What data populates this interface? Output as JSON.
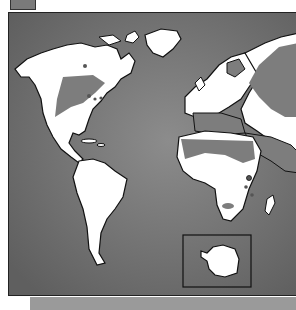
{
  "map": {
    "type": "world-map",
    "legend": {
      "swatch_color": "#7a7a7a"
    },
    "colors": {
      "ocean": "#6e6e6e",
      "ocean_highlight": "#8a8a8a",
      "land": "#ffffff",
      "shaded_region": "#7d7d7d",
      "outline": "#111111",
      "bottom_strip": "#9a9a9a"
    },
    "regions": [
      "North America",
      "South America",
      "Europe",
      "Africa",
      "Asia",
      "Greenland",
      "Antarctica (inset)"
    ],
    "shaded_areas": [
      "Central Canada / North American plains",
      "Northern Russia / Siberia",
      "Sahara and Arabian Peninsula",
      "Mediterranean basin",
      "Southern Africa (Kalahari patch)"
    ],
    "inset": {
      "label": "Antarctica"
    }
  }
}
